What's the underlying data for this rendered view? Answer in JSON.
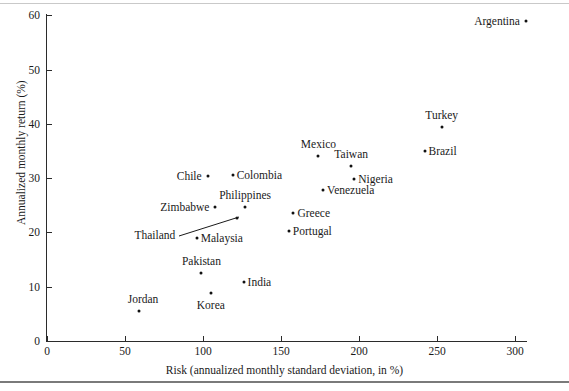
{
  "figure": {
    "background": "#ffffff",
    "point_color": "#111111",
    "axis_color": "#2b2b2b"
  },
  "chart_data": {
    "type": "scatter",
    "title": "",
    "xlabel": "Risk (annualized monthly standard deviation, in %)",
    "ylabel": "Annualized monthly return (%)",
    "xlim": [
      0,
      310
    ],
    "ylim": [
      0,
      60
    ],
    "xticks": [
      0,
      50,
      100,
      150,
      200,
      250,
      300
    ],
    "xtick_labels": [
      "0",
      "50",
      "100",
      "150",
      "200",
      "250",
      "300"
    ],
    "yticks": [
      0,
      10,
      20,
      30,
      40,
      50,
      60
    ],
    "ytick_labels": [
      "0",
      "10",
      "20",
      "30",
      "40",
      "50",
      "60"
    ],
    "grid": false,
    "legend": false,
    "points": [
      {
        "name": "Argentina",
        "x": 307,
        "y": 59.0,
        "label_pos": "left"
      },
      {
        "name": "Turkey",
        "x": 253,
        "y": 39.5,
        "label_pos": "above"
      },
      {
        "name": "Brazil",
        "x": 242,
        "y": 35.0,
        "label_pos": "right"
      },
      {
        "name": "Mexico",
        "x": 174,
        "y": 34.0,
        "label_pos": "above"
      },
      {
        "name": "Taiwan",
        "x": 195,
        "y": 32.2,
        "label_pos": "above"
      },
      {
        "name": "Chile",
        "x": 103,
        "y": 30.4,
        "label_pos": "left"
      },
      {
        "name": "Colombia",
        "x": 119,
        "y": 30.6,
        "label_pos": "right"
      },
      {
        "name": "Nigeria",
        "x": 197,
        "y": 29.9,
        "label_pos": "right"
      },
      {
        "name": "Venezuela",
        "x": 177,
        "y": 27.8,
        "label_pos": "right"
      },
      {
        "name": "Philippines",
        "x": 127,
        "y": 24.6,
        "label_pos": "above"
      },
      {
        "name": "Zimbabwe",
        "x": 108,
        "y": 24.6,
        "label_pos": "left"
      },
      {
        "name": "Greece",
        "x": 158,
        "y": 23.5,
        "label_pos": "right"
      },
      {
        "name": "Thailand",
        "x": 122,
        "y": 22.6,
        "label_pos": "leader"
      },
      {
        "name": "Portugal",
        "x": 155,
        "y": 20.3,
        "label_pos": "right"
      },
      {
        "name": "Malaysia",
        "x": 96,
        "y": 19.0,
        "label_pos": "right"
      },
      {
        "name": "Pakistan",
        "x": 99,
        "y": 12.6,
        "label_pos": "above"
      },
      {
        "name": "India",
        "x": 126,
        "y": 10.9,
        "label_pos": "right"
      },
      {
        "name": "Korea",
        "x": 105,
        "y": 8.9,
        "label_pos": "below"
      },
      {
        "name": "Jordan",
        "x": 59,
        "y": 5.5,
        "label_pos": "above-left"
      }
    ],
    "annotations": [
      {
        "type": "leader-line",
        "from_label": "Thailand",
        "to_point": "Thailand"
      }
    ]
  }
}
